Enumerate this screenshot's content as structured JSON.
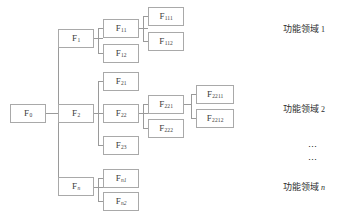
{
  "diagram": {
    "type": "tree",
    "title": "",
    "nodes": [
      {
        "id": "F0",
        "base": "F",
        "sub": "0",
        "sub_italic": false,
        "x": 10,
        "y": 104,
        "w": 36,
        "h": 19
      },
      {
        "id": "F1",
        "base": "F",
        "sub": "1",
        "sub_italic": false,
        "x": 58,
        "y": 29,
        "w": 36,
        "h": 19
      },
      {
        "id": "F11",
        "base": "F",
        "sub": "11",
        "sub_italic": false,
        "x": 103,
        "y": 19,
        "w": 36,
        "h": 19
      },
      {
        "id": "F12",
        "base": "F",
        "sub": "12",
        "sub_italic": false,
        "x": 103,
        "y": 44,
        "w": 36,
        "h": 19
      },
      {
        "id": "F111",
        "base": "F",
        "sub": "111",
        "sub_italic": false,
        "x": 148,
        "y": 7,
        "w": 36,
        "h": 19
      },
      {
        "id": "F112",
        "base": "F",
        "sub": "112",
        "sub_italic": false,
        "x": 148,
        "y": 32,
        "w": 36,
        "h": 19
      },
      {
        "id": "F2",
        "base": "F",
        "sub": "2",
        "sub_italic": false,
        "x": 58,
        "y": 104,
        "w": 36,
        "h": 19
      },
      {
        "id": "F21",
        "base": "F",
        "sub": "21",
        "sub_italic": false,
        "x": 103,
        "y": 72,
        "w": 36,
        "h": 19
      },
      {
        "id": "F22",
        "base": "F",
        "sub": "22",
        "sub_italic": false,
        "x": 103,
        "y": 104,
        "w": 36,
        "h": 19
      },
      {
        "id": "F23",
        "base": "F",
        "sub": "23",
        "sub_italic": false,
        "x": 103,
        "y": 136,
        "w": 36,
        "h": 19
      },
      {
        "id": "F221",
        "base": "F",
        "sub": "221",
        "sub_italic": false,
        "x": 148,
        "y": 95,
        "w": 36,
        "h": 19
      },
      {
        "id": "F222",
        "base": "F",
        "sub": "222",
        "sub_italic": false,
        "x": 148,
        "y": 119,
        "w": 36,
        "h": 19
      },
      {
        "id": "F2211",
        "base": "F",
        "sub": "2211",
        "sub_italic": false,
        "x": 196,
        "y": 85,
        "w": 38,
        "h": 19
      },
      {
        "id": "F2212",
        "base": "F",
        "sub": "2212",
        "sub_italic": false,
        "x": 196,
        "y": 109,
        "w": 38,
        "h": 19
      },
      {
        "id": "Fn",
        "base": "F",
        "sub": "n",
        "sub_italic": true,
        "x": 58,
        "y": 177,
        "w": 36,
        "h": 19
      },
      {
        "id": "Fn1",
        "base": "F",
        "sub": "n1",
        "sub_italic": true,
        "x": 103,
        "y": 169,
        "w": 36,
        "h": 19
      },
      {
        "id": "Fn2",
        "base": "F",
        "sub": "n2",
        "sub_italic": true,
        "x": 103,
        "y": 192,
        "w": 36,
        "h": 19
      }
    ],
    "edges": [
      {
        "name": "edge-f0-trunk",
        "orient": "h",
        "x": 46,
        "y": 113,
        "len": 12
      },
      {
        "name": "edge-trunk-vertical",
        "orient": "v",
        "x": 58,
        "y": 38,
        "len": 149
      },
      {
        "name": "edge-trunk-to-f1",
        "orient": "h",
        "x": 58,
        "y": 38,
        "len": 0
      },
      {
        "name": "edge-f1-out",
        "orient": "h",
        "x": 94,
        "y": 38,
        "len": 9
      },
      {
        "name": "edge-f1-split-v",
        "orient": "v",
        "x": 98,
        "y": 28,
        "len": 25
      },
      {
        "name": "edge-f1-to-f11",
        "orient": "h",
        "x": 98,
        "y": 28,
        "len": 5
      },
      {
        "name": "edge-f1-to-f12",
        "orient": "h",
        "x": 98,
        "y": 53,
        "len": 5
      },
      {
        "name": "edge-f11-out",
        "orient": "h",
        "x": 139,
        "y": 28,
        "len": 9
      },
      {
        "name": "edge-f11-split-v",
        "orient": "v",
        "x": 143,
        "y": 16,
        "len": 25
      },
      {
        "name": "edge-f11-to-f111",
        "orient": "h",
        "x": 143,
        "y": 16,
        "len": 5
      },
      {
        "name": "edge-f11-to-f112",
        "orient": "h",
        "x": 143,
        "y": 41,
        "len": 5
      },
      {
        "name": "edge-trunk-to-f2",
        "orient": "h",
        "x": 58,
        "y": 113,
        "len": 0
      },
      {
        "name": "edge-f2-out",
        "orient": "h",
        "x": 94,
        "y": 113,
        "len": 9
      },
      {
        "name": "edge-f2-split-v",
        "orient": "v",
        "x": 98,
        "y": 81,
        "len": 64
      },
      {
        "name": "edge-f2-to-f21",
        "orient": "h",
        "x": 98,
        "y": 81,
        "len": 5
      },
      {
        "name": "edge-f2-to-f22",
        "orient": "h",
        "x": 98,
        "y": 113,
        "len": 5
      },
      {
        "name": "edge-f2-to-f23",
        "orient": "h",
        "x": 98,
        "y": 145,
        "len": 5
      },
      {
        "name": "edge-f22-out",
        "orient": "h",
        "x": 139,
        "y": 113,
        "len": 9
      },
      {
        "name": "edge-f22-split-v",
        "orient": "v",
        "x": 143,
        "y": 104,
        "len": 24
      },
      {
        "name": "edge-f22-to-f221",
        "orient": "h",
        "x": 143,
        "y": 104,
        "len": 5
      },
      {
        "name": "edge-f22-to-f222",
        "orient": "h",
        "x": 143,
        "y": 128,
        "len": 5
      },
      {
        "name": "edge-f221-out",
        "orient": "h",
        "x": 184,
        "y": 104,
        "len": 8
      },
      {
        "name": "edge-f221-split-v",
        "orient": "v",
        "x": 191,
        "y": 94,
        "len": 24
      },
      {
        "name": "edge-f221-to-f2211",
        "orient": "h",
        "x": 191,
        "y": 94,
        "len": 5
      },
      {
        "name": "edge-f221-to-f2212",
        "orient": "h",
        "x": 191,
        "y": 118,
        "len": 5
      },
      {
        "name": "edge-trunk-to-fn",
        "orient": "h",
        "x": 58,
        "y": 187,
        "len": 0
      },
      {
        "name": "edge-fn-out",
        "orient": "h",
        "x": 94,
        "y": 187,
        "len": 9
      },
      {
        "name": "edge-fn-split-v",
        "orient": "v",
        "x": 98,
        "y": 178,
        "len": 23
      },
      {
        "name": "edge-fn-to-fn1",
        "orient": "h",
        "x": 98,
        "y": 178,
        "len": 5
      },
      {
        "name": "edge-fn-to-fn2",
        "orient": "h",
        "x": 98,
        "y": 201,
        "len": 5
      }
    ],
    "domain_labels": [
      {
        "id": "domain-1",
        "text": "功能领域",
        "index": "1",
        "index_italic": false,
        "x": 283,
        "y": 25
      },
      {
        "id": "domain-2",
        "text": "功能领域",
        "index": "2",
        "index_italic": false,
        "x": 283,
        "y": 105
      },
      {
        "id": "domain-n",
        "text": "功能领域",
        "index": "n",
        "index_italic": true,
        "x": 283,
        "y": 183
      }
    ],
    "ellipses": [
      {
        "id": "ellipsis-1",
        "text": "…",
        "x": 308,
        "y": 140
      },
      {
        "id": "ellipsis-2",
        "text": "…",
        "x": 308,
        "y": 153
      }
    ],
    "colors": {
      "box_border": "#a9a9a9",
      "line": "#9a9a9a",
      "text": "#3c3c3c",
      "label_text": "#2e2e2e",
      "background": "#ffffff"
    }
  }
}
